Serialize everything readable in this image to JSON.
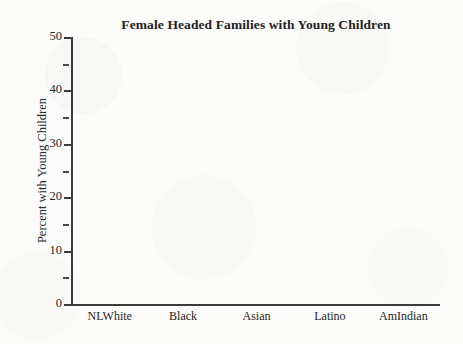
{
  "chart_data": {
    "type": "bar",
    "title": "Female Headed Families with Young Children",
    "xlabel": "",
    "ylabel": "Percent with Young Children",
    "categories": [
      "NLWhite",
      "Black",
      "Asian",
      "Latino",
      "AmIndian"
    ],
    "values": [
      null,
      null,
      null,
      null,
      null
    ],
    "series": [],
    "ylim": [
      0,
      50
    ],
    "y_major_ticks": [
      0,
      10,
      20,
      30,
      40,
      50
    ],
    "y_major_tick_labels": [
      "0",
      "10",
      "20",
      "30",
      "40",
      "50"
    ],
    "y_minor_ticks": [
      5,
      15,
      25,
      35,
      45
    ],
    "grid": false,
    "legend": false,
    "legend_position": "none",
    "colors": {
      "axis": "#3a3a3a",
      "text": "#262626",
      "title": "#232323",
      "background": "#fcfcfb"
    }
  }
}
